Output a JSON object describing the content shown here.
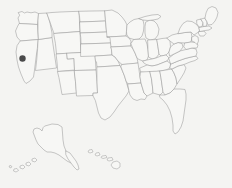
{
  "map": {
    "title": "United States Map",
    "subject": "usa-states-outline",
    "projection": "albers-usa",
    "background_color": "#f4f4f2",
    "land_fill_color": "#f7f7f5",
    "border_color": "#9a9a9a",
    "width": 232,
    "height": 188,
    "labels_visible": false,
    "graticule_visible": false
  },
  "markers": [
    {
      "id": "marker-1",
      "label": "",
      "region": "California",
      "color": "#4a4a4a",
      "x": 22.5,
      "y": 58.5,
      "radius": 3.2
    }
  ],
  "insets": [
    {
      "id": "alaska",
      "label": "Alaska"
    },
    {
      "id": "hawaii",
      "label": "Hawaii"
    }
  ],
  "regions": {
    "contiguous": "Contiguous United States",
    "alaska": "Alaska",
    "hawaii": "Hawaii"
  }
}
